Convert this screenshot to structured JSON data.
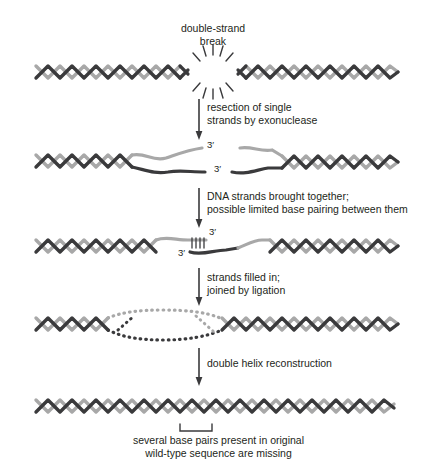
{
  "figure": {
    "title_label": "double-strand\nbreak",
    "caption": "several base pairs present in original\nwild-type sequence are missing",
    "colors": {
      "dark_strand": "#3a3a3c",
      "light_strand": "#a8a8a8",
      "text": "#231f20",
      "background": "#ffffff"
    },
    "steps": [
      {
        "name": "double-strand-break",
        "dna_label": "double-strand\nbreak",
        "arrow_label": "resection of single\nstrands by exonuclease"
      },
      {
        "name": "resected-strands",
        "prime_labels": [
          "3′",
          "3′"
        ],
        "arrow_label": "DNA strands brought together;\npossible limited base pairing between them"
      },
      {
        "name": "annealed-strands",
        "prime_labels": [
          "3′",
          "3′"
        ],
        "arrow_label": "strands filled in;\njoined by ligation"
      },
      {
        "name": "filled-ligated",
        "arrow_label": "double helix reconstruction"
      },
      {
        "name": "reconstructed-helix",
        "bracket_label": "several base pairs present in original\nwild-type sequence are missing"
      }
    ],
    "arrow_labels": [
      "resection of single\nstrands by exonuclease",
      "DNA strands brought together;\npossible limited base pairing between them",
      "strands filled in;\njoined by ligation",
      "double helix reconstruction"
    ],
    "prime_marks": {
      "row2_top": "3′",
      "row2_bottom": "3′",
      "row3_left": "3′",
      "row3_right": "3′"
    }
  }
}
